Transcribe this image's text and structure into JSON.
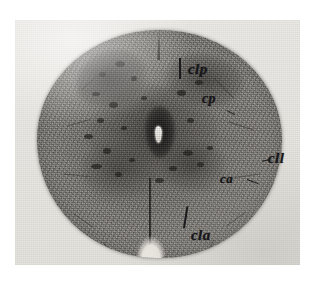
{
  "figure": {
    "kind": "histological-micrograph-plate",
    "caption": ""
  },
  "plate": {
    "background_color": "#e8e6e1",
    "border_color": "#cfccc6"
  },
  "specimen": {
    "name": "spinal-cord-section",
    "fill_color": "#7a7773",
    "grey_matter_color": "#2c2a28",
    "central_canal_color": "#f7f4ee"
  },
  "annotations": [
    {
      "id": "clp",
      "label": "clp",
      "name": "label-clp",
      "meaning": "columna lateralis posterior",
      "has_leader": true
    },
    {
      "id": "cp",
      "label": "cp",
      "name": "label-cp",
      "meaning": "cornu posterius",
      "has_leader": true
    },
    {
      "id": "cll",
      "label": "cll",
      "name": "label-cll",
      "meaning": "columna lateralis lateralis",
      "has_leader": true
    },
    {
      "id": "ca",
      "label": "ca",
      "name": "label-ca",
      "meaning": "cornu anterius",
      "has_leader": true
    },
    {
      "id": "cla",
      "label": "cla",
      "name": "label-cla",
      "meaning": "columna lateralis anterior",
      "has_leader": true
    }
  ],
  "features": {
    "central_canal": "central-canal",
    "posterior_median_sulcus": "posterior-median-sulcus",
    "anterior_median_fissure": "anterior-median-fissure"
  }
}
